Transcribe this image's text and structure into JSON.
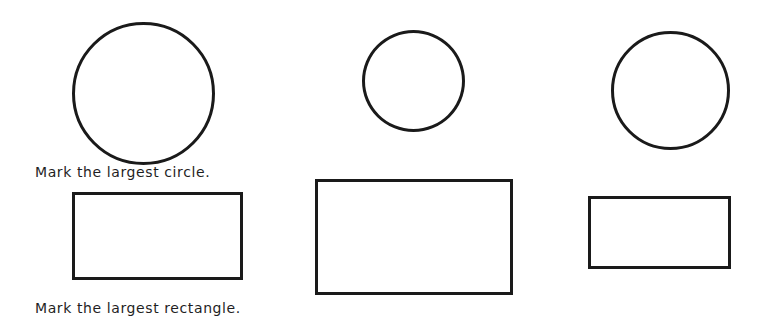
{
  "worksheet": {
    "circles_section": {
      "instruction": "Mark the largest circle.",
      "shapes": [
        {
          "type": "circle",
          "label": "circle-1",
          "size": "large"
        },
        {
          "type": "circle",
          "label": "circle-2",
          "size": "small"
        },
        {
          "type": "circle",
          "label": "circle-3",
          "size": "medium"
        }
      ]
    },
    "rectangles_section": {
      "instruction": "Mark the largest rectangle.",
      "shapes": [
        {
          "type": "rectangle",
          "label": "rectangle-1",
          "size": "medium"
        },
        {
          "type": "rectangle",
          "label": "rectangle-2",
          "size": "large"
        },
        {
          "type": "rectangle",
          "label": "rectangle-3",
          "size": "small"
        }
      ]
    },
    "colors": {
      "stroke": "#1a1a1a",
      "background": "#ffffff",
      "text": "#1f1f1f"
    }
  }
}
